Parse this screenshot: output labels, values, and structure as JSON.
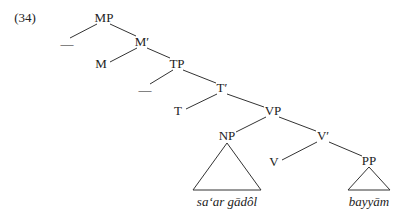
{
  "example_number": "(34)",
  "nodes": {
    "mp": "MP",
    "mp_spec": "—",
    "m_bar": "M′",
    "m": "M",
    "tp": "TP",
    "tp_spec": "—",
    "t_bar": "T′",
    "t": "T",
    "vp": "VP",
    "np": "NP",
    "v_bar": "V′",
    "v": "V",
    "pp": "PP"
  },
  "leaves": {
    "np_text": "sa‘ar gādôl",
    "pp_text": "bayyām"
  }
}
